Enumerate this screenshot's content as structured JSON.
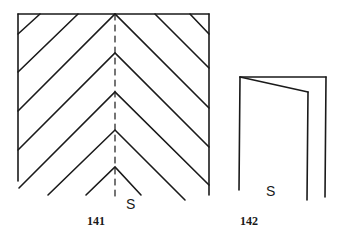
{
  "figures": [
    {
      "id": "141",
      "label": "141",
      "seam_label": "S",
      "description": "Herringbone chevron pattern in rectangular frame with dashed center seam line"
    },
    {
      "id": "142",
      "label": "142",
      "seam_label": "S",
      "description": "Folded panel shown in side view"
    }
  ],
  "colors": {
    "line": "#1a1a1a",
    "background": "#ffffff"
  }
}
